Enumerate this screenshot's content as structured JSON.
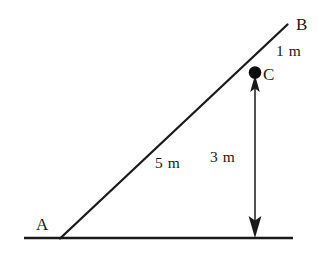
{
  "figure": {
    "background_color": "#ffffff",
    "stroke_color": "#1a1a1a",
    "text_color": "#1a1a1a"
  },
  "points": [
    {
      "id": "A",
      "label": "A",
      "role": "base-vertex",
      "x": 60,
      "y": 238
    },
    {
      "id": "B",
      "label": "B",
      "role": "upper-end",
      "x": 287,
      "y": 25
    },
    {
      "id": "C",
      "label": "C",
      "role": "marked-point",
      "x": 255,
      "y": 73
    }
  ],
  "segments": [
    {
      "id": "ground",
      "from": "ground-left",
      "to": "ground-right",
      "x1": 24,
      "y1": 238,
      "x2": 293,
      "y2": 238
    },
    {
      "id": "incline",
      "from": "A",
      "to": "B",
      "x1": 60,
      "y1": 238,
      "x2": 287,
      "y2": 25
    }
  ],
  "dimensions": [
    {
      "id": "len-AC",
      "label": "5 m",
      "value": 5,
      "unit": "m",
      "from": "A",
      "to": "C"
    },
    {
      "id": "len-CB",
      "label": "1 m",
      "value": 1,
      "unit": "m",
      "from": "C",
      "to": "B"
    },
    {
      "id": "len-CG",
      "label": "3 m",
      "value": 3,
      "unit": "m",
      "from": "C",
      "to": "ground"
    }
  ],
  "arrow": {
    "id": "height-arrow",
    "description": "double-headed vertical arrow from C down to ground",
    "x": 255,
    "y_top": 82,
    "y_bottom": 237,
    "head_top": "up",
    "head_bottom": "down"
  },
  "markers": [
    {
      "id": "dot-C",
      "shape": "filled-circle",
      "x": 255,
      "y": 73,
      "radius": 6
    }
  ]
}
